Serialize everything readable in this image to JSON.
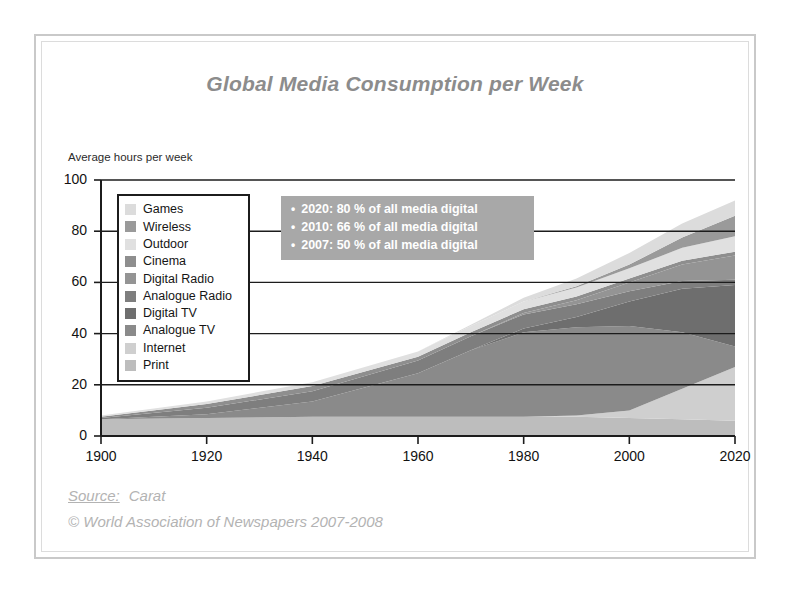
{
  "frame": {
    "border_color": "#c9c9c9",
    "inner_border_color": "#dcdcdc"
  },
  "header": {
    "title": "Global Media Consumption per Week"
  },
  "footer": {
    "source_label": "Source:",
    "source_value": "Carat",
    "copyright": "© World Association of Newspapers 2007-2008"
  },
  "callout": {
    "bullet_glyph": "•",
    "background": "#a8a8a8",
    "text_color": "#ffffff",
    "lines": [
      "2020: 80 %  of all media digital",
      "2010: 66 %  of all media digital",
      "2007: 50 %  of all media digital"
    ]
  },
  "legend": {
    "border_color": "#1c1c1c",
    "items": [
      {
        "label": "Games",
        "color": "#dcdcdc"
      },
      {
        "label": "Wireless",
        "color": "#9a9a9a"
      },
      {
        "label": "Outdoor",
        "color": "#e0e0e0"
      },
      {
        "label": "Cinema",
        "color": "#8e8e8e"
      },
      {
        "label": "Digital Radio",
        "color": "#949494"
      },
      {
        "label": "Analogue Radio",
        "color": "#7e7e7e"
      },
      {
        "label": "Digital TV",
        "color": "#6e6e6e"
      },
      {
        "label": "Analogue TV",
        "color": "#8a8a8a"
      },
      {
        "label": "Internet",
        "color": "#cfcfcf"
      },
      {
        "label": "Print",
        "color": "#bdbdbd"
      }
    ]
  },
  "chart_data": {
    "type": "area",
    "stacked": true,
    "title": "Global Media Consumption per Week",
    "xlabel": "",
    "ylabel": "Average hours per week",
    "xlim": [
      1900,
      2020
    ],
    "ylim": [
      0,
      100
    ],
    "xticks": [
      1900,
      1920,
      1940,
      1960,
      1980,
      2000,
      2020
    ],
    "yticks": [
      0,
      20,
      40,
      60,
      80,
      100
    ],
    "grid": true,
    "gridline_color": "#1c1c1c",
    "legend_position": "inside-left",
    "x": [
      1900,
      1920,
      1940,
      1960,
      1970,
      1980,
      1990,
      2000,
      2010,
      2020
    ],
    "series": [
      {
        "name": "Print",
        "color": "#bdbdbd",
        "values": [
          6.5,
          7.0,
          7.5,
          7.5,
          7.5,
          7.5,
          7.5,
          7.0,
          6.5,
          6.0
        ]
      },
      {
        "name": "Internet",
        "color": "#cfcfcf",
        "values": [
          0.0,
          0.0,
          0.0,
          0.0,
          0.0,
          0.0,
          0.5,
          3.0,
          12.0,
          21.0
        ]
      },
      {
        "name": "Analogue TV",
        "color": "#8a8a8a",
        "values": [
          0.0,
          1.5,
          6.0,
          17.0,
          26.0,
          33.0,
          34.5,
          33.0,
          22.0,
          8.0
        ]
      },
      {
        "name": "Digital TV",
        "color": "#6e6e6e",
        "values": [
          0.0,
          0.0,
          0.0,
          0.0,
          0.0,
          1.5,
          4.0,
          9.5,
          17.0,
          24.0
        ]
      },
      {
        "name": "Analogue Radio",
        "color": "#7e7e7e",
        "values": [
          0.5,
          2.5,
          4.0,
          5.0,
          5.5,
          5.5,
          5.0,
          4.0,
          3.0,
          2.0
        ]
      },
      {
        "name": "Digital Radio",
        "color": "#949494",
        "values": [
          0.0,
          0.0,
          0.0,
          0.0,
          0.0,
          0.5,
          1.5,
          3.5,
          6.5,
          9.5
        ]
      },
      {
        "name": "Cinema",
        "color": "#8e8e8e",
        "values": [
          0.5,
          1.5,
          2.0,
          1.5,
          1.5,
          1.5,
          1.5,
          1.5,
          1.5,
          1.5
        ]
      },
      {
        "name": "Outdoor",
        "color": "#e0e0e0",
        "values": [
          0.5,
          1.0,
          1.5,
          2.0,
          2.5,
          3.0,
          3.5,
          4.0,
          5.0,
          6.0
        ]
      },
      {
        "name": "Wireless",
        "color": "#9a9a9a",
        "values": [
          0.0,
          0.0,
          0.0,
          0.0,
          0.0,
          0.0,
          0.5,
          1.5,
          4.0,
          8.0
        ]
      },
      {
        "name": "Games",
        "color": "#dcdcdc",
        "values": [
          0.0,
          0.0,
          0.0,
          0.0,
          0.5,
          1.5,
          3.0,
          4.5,
          5.5,
          6.0
        ]
      }
    ],
    "totals": [
      8.0,
      13.5,
      21.0,
      33.0,
      43.5,
      47.0,
      55.5,
      60.0,
      75.0,
      92.0
    ],
    "annotations": [
      "2020: 80 % of all media digital",
      "2010: 66 % of all media digital",
      "2007: 50 % of all media digital"
    ]
  }
}
